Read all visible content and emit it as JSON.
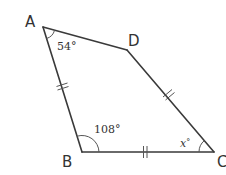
{
  "figure": {
    "type": "quadrilateral",
    "vertices": {
      "A": {
        "label": "A"
      },
      "B": {
        "label": "B"
      },
      "C": {
        "label": "C"
      },
      "D": {
        "label": "D"
      }
    },
    "angles": {
      "A": {
        "label": "54°"
      },
      "B": {
        "label": "108°"
      },
      "C": {
        "label_var": "x",
        "label_deg": "°"
      }
    },
    "equal_sides": [
      "AB",
      "BC",
      "CD"
    ],
    "tick_marks_per_side": 2
  },
  "colors": {
    "line": "#3a3a3a",
    "text": "#333333",
    "background": "#ffffff"
  }
}
